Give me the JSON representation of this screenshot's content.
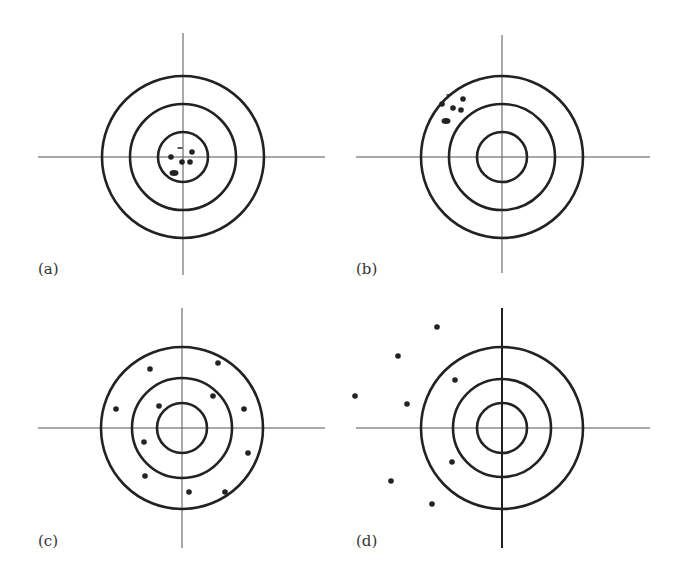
{
  "figure": {
    "colors": {
      "ink": "#222222",
      "axis": "#555555",
      "background": "#ffffff"
    },
    "panels": [
      {
        "label": "(a)",
        "center": [
          183,
          157
        ],
        "radii": [
          25,
          53,
          81
        ],
        "vline": [
          33,
          275
        ],
        "hline": [
          38,
          325
        ],
        "vline_width": 1,
        "label_pos": [
          38,
          274
        ],
        "dots": [
          [
            171,
            157
          ],
          [
            192,
            152
          ],
          [
            182,
            162
          ],
          [
            190,
            162
          ]
        ],
        "ovals": [
          [
            174,
            173
          ]
        ],
        "dashes": [
          [
            180,
            148
          ]
        ]
      },
      {
        "label": "(b)",
        "center": [
          502,
          157
        ],
        "radii": [
          25,
          53,
          81
        ],
        "vline": [
          35,
          273
        ],
        "hline": [
          356,
          650
        ],
        "vline_width": 1,
        "label_pos": [
          356,
          274
        ],
        "dots": [
          [
            442,
            104
          ],
          [
            463,
            99
          ],
          [
            453,
            108
          ],
          [
            461,
            110
          ]
        ],
        "ovals": [
          [
            446,
            121
          ]
        ],
        "dashes": [
          [
            449,
            95
          ]
        ]
      },
      {
        "label": "(c)",
        "center": [
          182,
          428
        ],
        "radii": [
          25,
          50,
          81
        ],
        "vline": [
          308,
          548
        ],
        "hline": [
          38,
          325
        ],
        "vline_width": 1,
        "label_pos": [
          38,
          546
        ],
        "dots": [
          [
            150,
            369
          ],
          [
            218,
            363
          ],
          [
            116,
            409
          ],
          [
            159,
            406
          ],
          [
            213,
            396
          ],
          [
            244,
            409
          ],
          [
            144,
            442
          ],
          [
            248,
            453
          ],
          [
            145,
            476
          ],
          [
            189,
            492
          ],
          [
            225,
            492
          ]
        ],
        "ovals": [],
        "dashes": []
      },
      {
        "label": "(d)",
        "center": [
          502,
          428
        ],
        "radii": [
          25,
          49,
          81
        ],
        "vline": [
          308,
          548
        ],
        "hline": [
          356,
          650
        ],
        "vline_width": 2,
        "label_pos": [
          356,
          546
        ],
        "dots": [
          [
            437,
            327
          ],
          [
            398,
            356
          ],
          [
            455,
            380
          ],
          [
            355,
            396
          ],
          [
            407,
            404
          ],
          [
            452,
            462
          ],
          [
            391,
            481
          ],
          [
            432,
            504
          ]
        ],
        "ovals": [],
        "dashes": []
      }
    ]
  }
}
